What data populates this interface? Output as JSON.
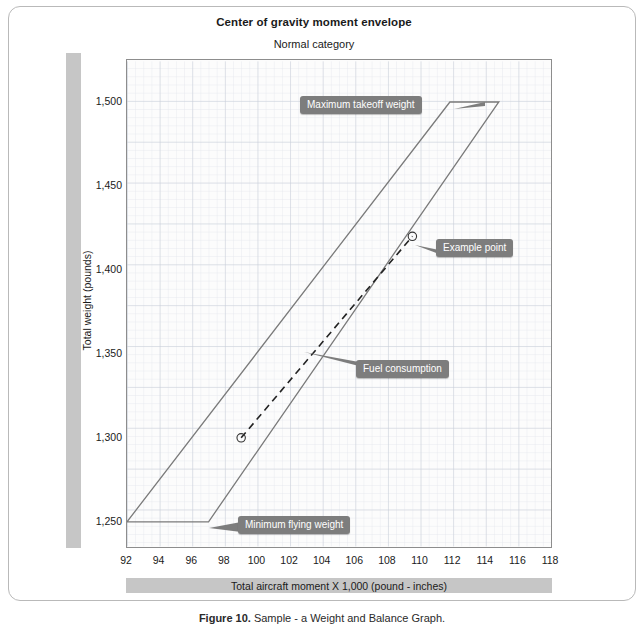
{
  "figure": {
    "title": "Center of gravity moment envelope",
    "subtitle": "Normal category",
    "caption_prefix": "Figure 10.",
    "caption_text": " Sample - a Weight and Balance Graph."
  },
  "axes": {
    "x_title": "Total aircraft moment X 1,000 (pound - inches)",
    "y_title": "Total weight (pounds)",
    "x_ticks": [
      "92",
      "94",
      "96",
      "98",
      "100",
      "102",
      "104",
      "106",
      "108",
      "110",
      "112",
      "114",
      "116",
      "118"
    ],
    "y_ticks": [
      "1,500",
      "1,450",
      "1,400",
      "1,350",
      "1,300",
      "1,250"
    ]
  },
  "callouts": {
    "max_takeoff": "Maximum takeoff weight",
    "example_point": "Example point",
    "fuel_consumption": "Fuel consumption",
    "min_flying": "Minimum flying weight"
  },
  "colors": {
    "envelope_line": "#7a7a7a",
    "callout_bg": "#7d7d7d",
    "grid_minor": "#dfe3ea",
    "grid_major": "#c3cad6",
    "axis_bar": "#c6c6c6",
    "plot_border": "#8d8d8d"
  },
  "chart_data": {
    "type": "line",
    "title": "Center of gravity moment envelope",
    "subtitle": "Normal category",
    "xlabel": "Total aircraft moment X 1,000 (pound - inches)",
    "ylabel": "Total weight (pounds)",
    "xlim": [
      92,
      118
    ],
    "ylim": [
      1235,
      1525
    ],
    "xticks": [
      92,
      94,
      96,
      98,
      100,
      102,
      104,
      106,
      108,
      110,
      112,
      114,
      116,
      118
    ],
    "yticks": [
      1250,
      1300,
      1350,
      1400,
      1450,
      1500
    ],
    "grid": true,
    "grid_minor_step": {
      "x": 0.5,
      "y": 10
    },
    "legend": "none",
    "series": [
      {
        "name": "Normal category envelope",
        "style": "solid",
        "closed": true,
        "points": [
          {
            "x": 92.0,
            "y": 1250
          },
          {
            "x": 111.8,
            "y": 1500
          },
          {
            "x": 114.8,
            "y": 1500
          },
          {
            "x": 97.0,
            "y": 1250
          },
          {
            "x": 92.0,
            "y": 1250
          }
        ]
      },
      {
        "name": "Fuel consumption",
        "style": "dashed",
        "closed": false,
        "points": [
          {
            "x": 99.0,
            "y": 1300
          },
          {
            "x": 109.5,
            "y": 1420
          }
        ]
      }
    ],
    "markers": [
      {
        "name": "Loaded aircraft (example point)",
        "x": 109.5,
        "y": 1420,
        "shape": "circle-open"
      },
      {
        "name": "Aircraft after fuel burn",
        "x": 99.0,
        "y": 1300,
        "shape": "circle-open"
      }
    ],
    "annotations": [
      {
        "text": "Maximum takeoff weight",
        "x": 106.5,
        "y": 1505
      },
      {
        "text": "Example point",
        "x": 111.5,
        "y": 1418
      },
      {
        "text": "Fuel consumption",
        "x": 106.0,
        "y": 1352
      },
      {
        "text": "Minimum flying weight",
        "x": 99.5,
        "y": 1249
      }
    ]
  }
}
